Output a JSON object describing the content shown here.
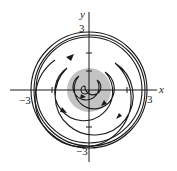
{
  "diagram": {
    "type": "phase-portrait",
    "axes": {
      "x_label": "x",
      "y_label": "y",
      "x_ticks": [
        {
          "value": -3,
          "label": "−3"
        },
        {
          "value": 3,
          "label": "3"
        }
      ],
      "y_ticks": [
        {
          "value": 3,
          "label": "3"
        },
        {
          "value": -3,
          "label": "−3"
        }
      ],
      "minor_ticks": [
        -2,
        -1,
        1,
        2
      ]
    },
    "colors": {
      "curve": "#1a1a1a",
      "shaded_region": "#b8b8b8",
      "axis": "#1a1a1a"
    },
    "shaded_region_radius": 1.2,
    "limit_cycle_radius": 3,
    "direction": "counterclockwise"
  }
}
